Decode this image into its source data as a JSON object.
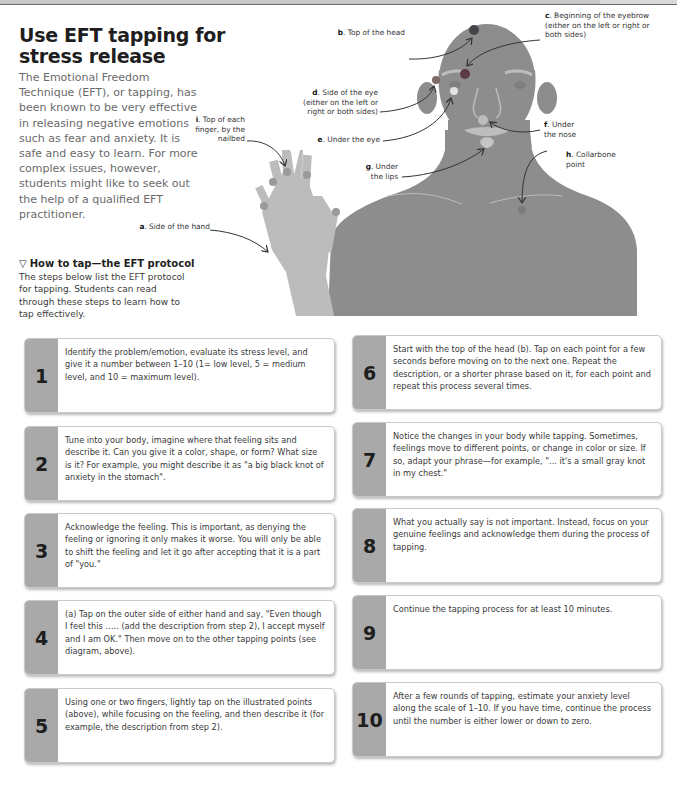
{
  "title": "Use EFT tapping for stress release",
  "intro": "The Emotional Freedom Technique (EFT), or tapping, has been known to be very effective in releasing negative emotions such as fear and anxiety. It is safe and easy to learn. For more complex issues, however, students might like to seek out the help of a qualified EFT practitioner.",
  "howto": {
    "icon": "▽",
    "heading": "How to tap—the EFT protocol",
    "body": "The steps below list the EFT protocol for tapping. Students can read through these steps to learn how to tap effectively."
  },
  "diagram": {
    "colors": {
      "body": "#8d8d8d",
      "hand": "#bcbcbc",
      "point_dark": "#46424a",
      "point_mid": "#7c7c7c",
      "point_light": "#e2e2e2",
      "tab": "#a9a9a9"
    },
    "labels": {
      "a": {
        "letter": "a",
        "text": ". Side of the hand"
      },
      "b": {
        "letter": "b",
        "text": ". Top of the head"
      },
      "c": {
        "letter": "c",
        "text": ". Beginning of the eyebrow (either on the left or right or both sides)"
      },
      "d": {
        "letter": "d",
        "text": ". Side of the eye (either on the left or right or both sides)"
      },
      "e": {
        "letter": "e",
        "text": ". Under the eye"
      },
      "f": {
        "letter": "f",
        "text": ". Under the nose"
      },
      "g": {
        "letter": "g",
        "text": ". Under the lips"
      },
      "h": {
        "letter": "h",
        "text": ". Collarbone point"
      },
      "i": {
        "letter": "i",
        "text": ". Top of each finger, by the nailbed"
      }
    }
  },
  "steps": [
    {
      "number": "1",
      "text": "Identify the problem/emotion, evaluate its stress level, and give it a number between 1–10 (1= low level, 5 = medium level, and 10 = maximum level)."
    },
    {
      "number": "2",
      "text": "Tune into your body, imagine where that feeling sits and describe it. Can you give it a color, shape, or form? What size is it? For example, you might describe it as \"a big black knot of anxiety in the stomach\"."
    },
    {
      "number": "3",
      "text": "Acknowledge the feeling. This is important, as denying the feeling or ignoring it only makes it worse. You will only be able to shift the feeling and let it go after accepting that it is a part of \"you.\""
    },
    {
      "number": "4",
      "text": "(a) Tap on the outer side of either hand and say, \"Even though I feel this ….. (add the description from step 2), I accept myself and I am OK.\" Then move on to the other tapping points (see diagram, above)."
    },
    {
      "number": "5",
      "text": "Using one or two fingers, lightly tap on the illustrated points (above), while focusing on the feeling, and then describe it (for example, the description from step 2)."
    },
    {
      "number": "6",
      "text": "Start with the top of the head (b). Tap on each point for a few seconds before moving on to the next one. Repeat the description, or a shorter phrase based on it, for each point and repeat this process several times."
    },
    {
      "number": "7",
      "text": "Notice the changes in your body while tapping. Sometimes, feelings move to different points, or change in color or size. If so, adapt your phrase—for example, \"... it's a small gray knot in my chest.\""
    },
    {
      "number": "8",
      "text": "What you actually say is not important. Instead, focus on your genuine feelings and acknowledge them during the process of tapping."
    },
    {
      "number": "9",
      "text": "Continue the tapping process for at least 10 minutes."
    },
    {
      "number": "10",
      "text": "After a few rounds of tapping, estimate your anxiety level along the scale of 1–10. If you have time, continue the process until the number is either lower or down to zero."
    }
  ]
}
